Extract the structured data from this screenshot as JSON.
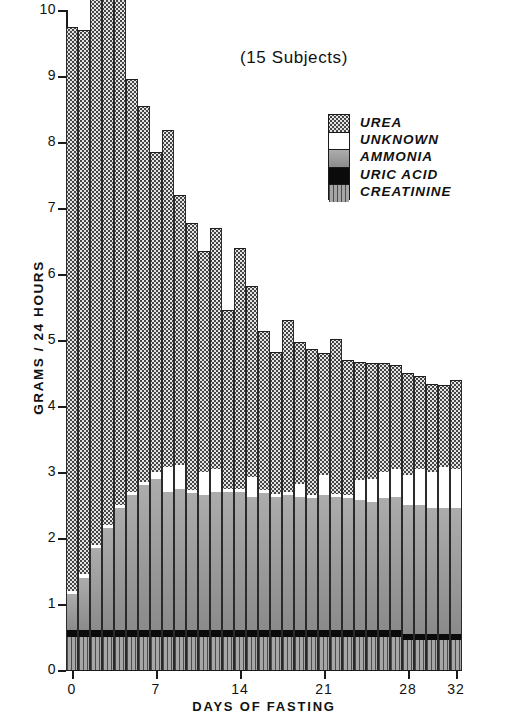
{
  "chart_data": {
    "type": "bar",
    "stacked": true,
    "title": "(15 Subjects)",
    "xlabel": "DAYS OF FASTING",
    "ylabel": "GRAMS / 24 HOURS",
    "ylim": [
      0,
      10
    ],
    "xlim": [
      -0.5,
      32.5
    ],
    "ytick_labels": [
      "0",
      "1",
      "2",
      "3",
      "4",
      "5",
      "6",
      "7",
      "8",
      "9",
      "10"
    ],
    "yticks": [
      0,
      1,
      2,
      3,
      4,
      5,
      6,
      7,
      8,
      9,
      10
    ],
    "xtick_labels": [
      "0",
      "7",
      "14",
      "21",
      "28",
      "32"
    ],
    "xticks": [
      0,
      7,
      14,
      21,
      28,
      32
    ],
    "grid": false,
    "legend_position": "upper right",
    "categories": [
      0,
      1,
      2,
      3,
      4,
      5,
      6,
      7,
      8,
      9,
      10,
      11,
      12,
      13,
      14,
      15,
      16,
      17,
      18,
      19,
      20,
      21,
      22,
      23,
      24,
      25,
      26,
      27,
      28,
      29,
      30,
      31,
      32
    ],
    "series": [
      {
        "name": "CREATININE",
        "color": "#a6a6a6",
        "pattern": "vertical-lines",
        "values": [
          0.5,
          0.5,
          0.5,
          0.5,
          0.5,
          0.5,
          0.5,
          0.5,
          0.5,
          0.5,
          0.5,
          0.5,
          0.5,
          0.5,
          0.5,
          0.5,
          0.5,
          0.5,
          0.5,
          0.5,
          0.5,
          0.5,
          0.5,
          0.5,
          0.5,
          0.5,
          0.5,
          0.5,
          0.45,
          0.45,
          0.45,
          0.45,
          0.45
        ]
      },
      {
        "name": "URIC ACID",
        "color": "#0b0b0b",
        "pattern": "solid-black",
        "values": [
          0.1,
          0.1,
          0.1,
          0.1,
          0.1,
          0.1,
          0.1,
          0.1,
          0.1,
          0.1,
          0.1,
          0.1,
          0.1,
          0.1,
          0.1,
          0.1,
          0.1,
          0.1,
          0.1,
          0.1,
          0.1,
          0.1,
          0.1,
          0.1,
          0.1,
          0.1,
          0.1,
          0.1,
          0.1,
          0.1,
          0.1,
          0.1,
          0.1
        ]
      },
      {
        "name": "AMMONIA",
        "color": "#9a9a9a",
        "pattern": "solid-gray",
        "values": [
          0.55,
          0.8,
          1.25,
          1.55,
          1.85,
          2.05,
          2.2,
          2.3,
          2.1,
          2.15,
          2.08,
          2.05,
          2.1,
          2.1,
          2.1,
          2.02,
          2.08,
          2.02,
          2.05,
          2.02,
          2.0,
          2.05,
          2.02,
          2.0,
          1.98,
          1.95,
          2.0,
          2.02,
          1.95,
          1.95,
          1.9,
          1.9,
          1.9
        ]
      },
      {
        "name": "UNKNOWN",
        "color": "#ffffff",
        "pattern": "white",
        "values": [
          0.05,
          0.05,
          0.05,
          0.05,
          0.05,
          0.05,
          0.05,
          0.1,
          0.38,
          0.35,
          0.05,
          0.35,
          0.35,
          0.05,
          0.05,
          0.3,
          0.05,
          0.05,
          0.05,
          0.2,
          0.05,
          0.3,
          0.05,
          0.05,
          0.3,
          0.35,
          0.4,
          0.42,
          0.45,
          0.55,
          0.55,
          0.62,
          0.6
        ]
      },
      {
        "name": "UREA",
        "color": "#e4e4e4",
        "pattern": "dotted-check",
        "values": [
          8.55,
          8.25,
          8.9,
          8.5,
          8.1,
          6.25,
          5.7,
          4.85,
          5.1,
          4.1,
          4.05,
          3.35,
          3.65,
          2.7,
          3.65,
          2.9,
          2.4,
          2.15,
          2.6,
          2.15,
          2.22,
          1.85,
          2.35,
          2.05,
          1.78,
          1.75,
          1.65,
          1.58,
          1.55,
          1.4,
          1.34,
          1.25,
          1.35
        ]
      }
    ],
    "totals": [
      9.75,
      9.7,
      10.8,
      10.7,
      10.6,
      8.95,
      8.55,
      7.85,
      8.18,
      7.2,
      6.78,
      6.25,
      6.7,
      5.45,
      6.4,
      5.74,
      5.03,
      4.82,
      5.3,
      4.87,
      4.87,
      4.8,
      5.02,
      4.7,
      4.66,
      4.65,
      4.65,
      4.62,
      4.5,
      4.45,
      4.34,
      4.32,
      4.4
    ],
    "annotations": []
  },
  "legend": {
    "items": [
      {
        "label": "UREA",
        "swatch": "p-urea"
      },
      {
        "label": "UNKNOWN",
        "swatch": "p-unknown"
      },
      {
        "label": "AMMONIA",
        "swatch": "p-ammonia"
      },
      {
        "label": "URIC ACID",
        "swatch": "p-uric"
      },
      {
        "label": "CREATININE",
        "swatch": "p-creat"
      }
    ]
  }
}
